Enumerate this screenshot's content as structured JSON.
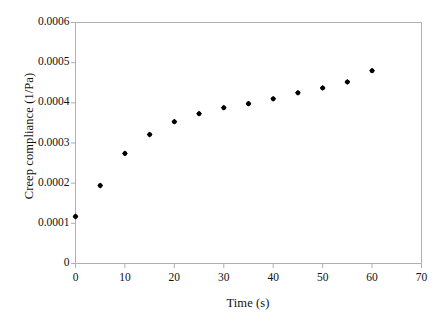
{
  "chart_data": {
    "type": "scatter",
    "title": "",
    "xlabel": "Time (s)",
    "ylabel": "Creep compliance (1/Pa)",
    "xlim": [
      0,
      70
    ],
    "ylim": [
      0,
      0.0006
    ],
    "grid": false,
    "legend": null,
    "xticks": [
      0,
      10,
      20,
      30,
      40,
      50,
      60,
      70
    ],
    "xtick_labels": [
      "0",
      "10",
      "20",
      "30",
      "40",
      "50",
      "60",
      "70"
    ],
    "yticks": [
      0,
      0.0001,
      0.0002,
      0.0003,
      0.0004,
      0.0005,
      0.0006
    ],
    "ytick_labels": [
      "0",
      "0.0001",
      "0.0002",
      "0.0003",
      "0.0004",
      "0.0005",
      "0.0006"
    ],
    "marker": "filled-diamond",
    "marker_color": "#000000",
    "x": [
      0,
      5,
      10,
      15,
      20,
      25,
      30,
      35,
      40,
      45,
      50,
      55,
      60
    ],
    "values": [
      0.000117,
      0.000194,
      0.000274,
      0.000321,
      0.000353,
      0.000373,
      0.000388,
      0.000398,
      0.00041,
      0.000425,
      0.000437,
      0.000452,
      0.00048
    ],
    "series": [
      {
        "name": "Creep compliance",
        "points": [
          {
            "x": 0,
            "y": 0.000117
          },
          {
            "x": 5,
            "y": 0.000194
          },
          {
            "x": 10,
            "y": 0.000274
          },
          {
            "x": 15,
            "y": 0.000321
          },
          {
            "x": 20,
            "y": 0.000353
          },
          {
            "x": 25,
            "y": 0.000373
          },
          {
            "x": 30,
            "y": 0.000388
          },
          {
            "x": 35,
            "y": 0.000398
          },
          {
            "x": 40,
            "y": 0.00041
          },
          {
            "x": 45,
            "y": 0.000425
          },
          {
            "x": 50,
            "y": 0.000437
          },
          {
            "x": 55,
            "y": 0.000452
          },
          {
            "x": 60,
            "y": 0.00048
          }
        ]
      }
    ]
  },
  "axes": {
    "frame_color": "#b0b0b0",
    "tick_color": "#b0b0b0",
    "background": "#ffffff"
  }
}
